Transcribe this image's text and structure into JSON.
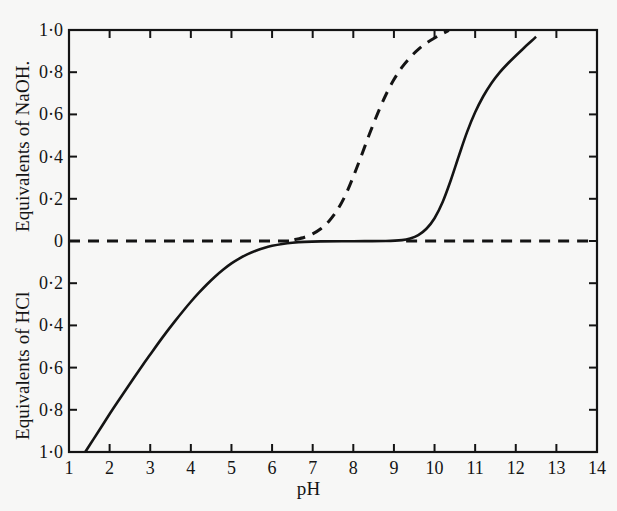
{
  "figure": {
    "background_color": "#f7f7f6",
    "ink_color": "#141414"
  },
  "axes": {
    "x_title": "pH",
    "y_title_upper": "Equivalents of NaOH.",
    "y_title_lower": "Equivalents of HCl",
    "x_ticks": [
      "1",
      "2",
      "3",
      "4",
      "5",
      "6",
      "7",
      "8",
      "9",
      "10",
      "11",
      "12",
      "13",
      "14"
    ],
    "y_ticks_upper": [
      "1·0",
      "0·8",
      "0·6",
      "0·4",
      "0·2",
      "0"
    ],
    "y_ticks_lower": [
      "0·2",
      "0·4",
      "0·6",
      "0·8",
      "1·0"
    ]
  },
  "chart_data": {
    "type": "line",
    "title": "",
    "xlabel": "pH",
    "ylabel": "Equivalents of NaOH. / Equivalents of HCl",
    "xlim": [
      1,
      14
    ],
    "ylim": [
      -1,
      1
    ],
    "grid": false,
    "legend": "none",
    "y_axis_note": "Upper half (0 to 1·0) is Equivalents of NaOH reading upward; lower half (0 to 1·0) is Equivalents of HCl reading downward. Zero is the shared midline.",
    "x_tick_values": [
      1,
      2,
      3,
      4,
      5,
      6,
      7,
      8,
      9,
      10,
      11,
      12,
      13,
      14
    ],
    "y_tick_values_upper": [
      1.0,
      0.8,
      0.6,
      0.4,
      0.2,
      0
    ],
    "y_tick_values_lower": [
      0.2,
      0.4,
      0.6,
      0.8,
      1.0
    ],
    "series": [
      {
        "name": "solid-titration-curve",
        "style": "solid",
        "color": "#141414",
        "points": [
          [
            1.4,
            -1.0
          ],
          [
            1.6,
            -0.94
          ],
          [
            1.8,
            -0.88
          ],
          [
            2.0,
            -0.82
          ],
          [
            2.2,
            -0.762
          ],
          [
            2.4,
            -0.705
          ],
          [
            2.6,
            -0.648
          ],
          [
            2.8,
            -0.592
          ],
          [
            3.0,
            -0.538
          ],
          [
            3.2,
            -0.484
          ],
          [
            3.4,
            -0.432
          ],
          [
            3.6,
            -0.382
          ],
          [
            3.8,
            -0.334
          ],
          [
            4.0,
            -0.288
          ],
          [
            4.2,
            -0.245
          ],
          [
            4.4,
            -0.205
          ],
          [
            4.6,
            -0.168
          ],
          [
            4.8,
            -0.135
          ],
          [
            5.0,
            -0.106
          ],
          [
            5.2,
            -0.082
          ],
          [
            5.4,
            -0.062
          ],
          [
            5.6,
            -0.046
          ],
          [
            5.8,
            -0.033
          ],
          [
            6.0,
            -0.023
          ],
          [
            6.25,
            -0.014
          ],
          [
            6.5,
            -0.008
          ],
          [
            6.8,
            -0.004
          ],
          [
            7.2,
            -0.002
          ],
          [
            8.0,
            -0.001
          ],
          [
            8.8,
            0.0
          ],
          [
            9.2,
            0.004
          ],
          [
            9.4,
            0.012
          ],
          [
            9.6,
            0.028
          ],
          [
            9.8,
            0.058
          ],
          [
            10.0,
            0.108
          ],
          [
            10.2,
            0.185
          ],
          [
            10.4,
            0.288
          ],
          [
            10.6,
            0.404
          ],
          [
            10.8,
            0.516
          ],
          [
            11.0,
            0.61
          ],
          [
            11.2,
            0.686
          ],
          [
            11.4,
            0.748
          ],
          [
            11.6,
            0.798
          ],
          [
            11.8,
            0.84
          ],
          [
            12.0,
            0.878
          ],
          [
            12.2,
            0.915
          ],
          [
            12.4,
            0.95
          ],
          [
            12.5,
            0.968
          ]
        ]
      },
      {
        "name": "dashed-curve-left-baseline",
        "style": "dashed",
        "color": "#141414",
        "points": [
          [
            1.0,
            0.0
          ],
          [
            6.55,
            0.0
          ]
        ]
      },
      {
        "name": "dashed-curve-rise",
        "style": "dashed",
        "color": "#141414",
        "points": [
          [
            6.55,
            0.006
          ],
          [
            6.8,
            0.018
          ],
          [
            7.0,
            0.034
          ],
          [
            7.2,
            0.058
          ],
          [
            7.4,
            0.094
          ],
          [
            7.6,
            0.145
          ],
          [
            7.8,
            0.215
          ],
          [
            8.0,
            0.305
          ],
          [
            8.2,
            0.405
          ],
          [
            8.4,
            0.508
          ],
          [
            8.6,
            0.605
          ],
          [
            8.8,
            0.692
          ],
          [
            9.0,
            0.765
          ],
          [
            9.2,
            0.824
          ],
          [
            9.4,
            0.87
          ],
          [
            9.6,
            0.908
          ],
          [
            9.8,
            0.938
          ],
          [
            10.0,
            0.962
          ],
          [
            10.2,
            0.983
          ],
          [
            10.35,
            0.998
          ]
        ]
      },
      {
        "name": "dashed-curve-right-baseline",
        "style": "dashed",
        "color": "#141414",
        "points": [
          [
            9.3,
            0.0
          ],
          [
            14.0,
            0.0
          ]
        ]
      }
    ]
  }
}
